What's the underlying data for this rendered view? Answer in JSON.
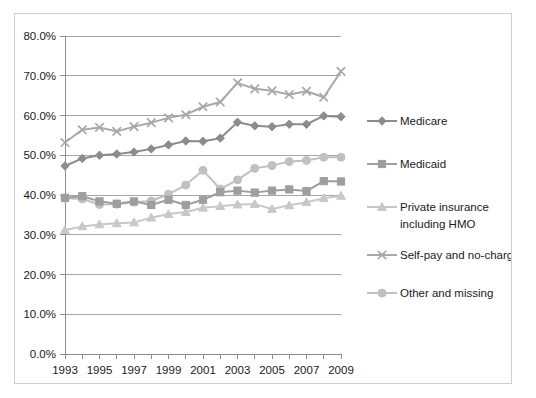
{
  "chart_data": {
    "type": "line",
    "title": "",
    "xlabel": "",
    "ylabel": "",
    "x": [
      1993,
      1994,
      1995,
      1996,
      1997,
      1998,
      1999,
      2000,
      2001,
      2002,
      2003,
      2004,
      2005,
      2006,
      2007,
      2008,
      2009
    ],
    "xtick_labels": [
      "1993",
      "1995",
      "1997",
      "1999",
      "2001",
      "2003",
      "2005",
      "2007",
      "2009"
    ],
    "xtick_values": [
      1993,
      1995,
      1997,
      1999,
      2001,
      2003,
      2005,
      2007,
      2009
    ],
    "ytick_labels": [
      "0.0%",
      "10.0%",
      "20.0%",
      "30.0%",
      "40.0%",
      "50.0%",
      "60.0%",
      "70.0%",
      "80.0%"
    ],
    "ytick_values": [
      0,
      10,
      20,
      30,
      40,
      50,
      60,
      70,
      80
    ],
    "ylim": [
      0,
      80
    ],
    "xlim": [
      1993,
      2009
    ],
    "grid": true,
    "legend_position": "right",
    "series": [
      {
        "name": "Medicare",
        "color": "#8c8c8c",
        "marker": "diamond",
        "values": [
          47.3,
          49.2,
          50.0,
          50.3,
          50.8,
          51.6,
          52.6,
          53.6,
          53.5,
          54.3,
          58.3,
          57.4,
          57.2,
          57.8,
          57.8,
          59.9,
          59.7
        ]
      },
      {
        "name": "Medicaid",
        "color": "#9e9e9e",
        "marker": "square",
        "values": [
          39.3,
          39.7,
          38.4,
          37.8,
          38.4,
          37.5,
          38.8,
          37.5,
          38.8,
          40.7,
          41.1,
          40.6,
          41.1,
          41.4,
          41.0,
          43.5,
          43.4
        ]
      },
      {
        "name": "Private insurance including HMO",
        "color": "#c8c8c8",
        "marker": "triangle",
        "values": [
          31.2,
          32.1,
          32.6,
          32.9,
          33.1,
          34.3,
          35.2,
          35.7,
          36.8,
          37.2,
          37.6,
          37.7,
          36.5,
          37.4,
          38.2,
          39.2,
          39.8
        ]
      },
      {
        "name": "Self-pay and no-charge",
        "color": "#a8a8a8",
        "marker": "x",
        "values": [
          53.2,
          56.4,
          57.0,
          56.0,
          57.2,
          58.2,
          59.4,
          60.2,
          62.2,
          63.4,
          68.2,
          66.7,
          66.2,
          65.3,
          66.1,
          64.6,
          71.1
        ]
      },
      {
        "name": "Other and missing",
        "color": "#c0c0c0",
        "marker": "circle",
        "values": [
          39.2,
          39.0,
          37.6,
          37.7,
          38.2,
          38.5,
          40.2,
          42.5,
          46.2,
          41.5,
          43.8,
          46.7,
          47.4,
          48.4,
          48.7,
          49.5,
          49.5
        ]
      }
    ]
  },
  "legend": {
    "entries": [
      {
        "label": "Medicare"
      },
      {
        "label": "Medicaid"
      },
      {
        "label": "Private insurance"
      },
      {
        "label": "including HMO"
      },
      {
        "label": "Self-pay and no-charge"
      },
      {
        "label": "Other and missing"
      }
    ]
  }
}
